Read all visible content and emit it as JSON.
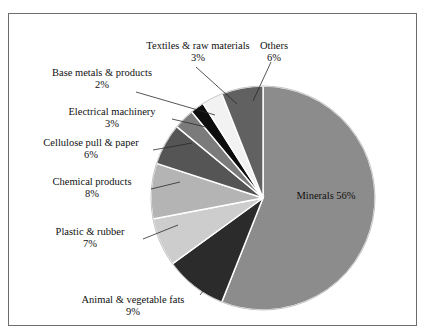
{
  "figure": {
    "top_cut_caption": "",
    "frame_color": "#6d6d6d",
    "background": "#ffffff"
  },
  "chart_data": {
    "type": "pie",
    "title": "",
    "subtitle": "",
    "xlabel": "",
    "ylabel": "",
    "legend_position": "none",
    "grid": false,
    "start_angle_deg": 0,
    "direction": "clockwise",
    "units": "percent",
    "total": 100,
    "categories": [
      "Minerals",
      "Animal & vegetable fats",
      "Plastic & rubber",
      "Chemical products",
      "Cellulose pull & paper",
      "Electrical machinery",
      "Base metals & products",
      "Textiles & raw materials",
      "Others"
    ],
    "values": [
      56,
      9,
      7,
      8,
      6,
      3,
      2,
      3,
      6
    ],
    "colors": [
      "#8c8c8c",
      "#2b2b2b",
      "#cdcdcd",
      "#b4b4b4",
      "#555555",
      "#7b7b7b",
      "#0d0d0d",
      "#f2f2f2",
      "#616161"
    ],
    "slices": [
      {
        "label": "Minerals",
        "value": 56,
        "display": "56%",
        "color": "#8c8c8c",
        "label_placement": "inside"
      },
      {
        "label": "Animal & vegetable fats",
        "value": 9,
        "display": "9%",
        "color": "#2b2b2b",
        "label_placement": "outside"
      },
      {
        "label": "Plastic & rubber",
        "value": 7,
        "display": "7%",
        "color": "#cdcdcd",
        "label_placement": "outside"
      },
      {
        "label": "Chemical products",
        "value": 8,
        "display": "8%",
        "color": "#b4b4b4",
        "label_placement": "outside"
      },
      {
        "label": "Cellulose pull & paper",
        "value": 6,
        "display": "6%",
        "color": "#555555",
        "label_placement": "outside"
      },
      {
        "label": "Electrical machinery",
        "value": 3,
        "display": "3%",
        "color": "#7b7b7b",
        "label_placement": "outside"
      },
      {
        "label": "Base metals & products",
        "value": 2,
        "display": "2%",
        "color": "#0d0d0d",
        "label_placement": "outside"
      },
      {
        "label": "Textiles & raw materials",
        "value": 3,
        "display": "3%",
        "color": "#f2f2f2",
        "label_placement": "outside"
      },
      {
        "label": "Others",
        "value": 6,
        "display": "6%",
        "color": "#616161",
        "label_placement": "outside"
      }
    ]
  },
  "labels": {
    "minerals": {
      "name": "Minerals",
      "pct": "56%"
    },
    "animal_vegetable_fats": {
      "name": "Animal & vegetable fats",
      "pct": "9%"
    },
    "plastic_rubber": {
      "name": "Plastic & rubber",
      "pct": "7%"
    },
    "chemical_products": {
      "name": "Chemical products",
      "pct": "8%"
    },
    "cellulose_pull_paper": {
      "name": "Cellulose pull & paper",
      "pct": "6%"
    },
    "electrical_machinery": {
      "name": "Electrical machinery",
      "pct": "3%"
    },
    "base_metals_products": {
      "name": "Base metals & products",
      "pct": "2%"
    },
    "textiles_raw_materials": {
      "name": "Textiles & raw materials",
      "pct": "3%"
    },
    "others": {
      "name": "Others",
      "pct": "6%"
    }
  }
}
